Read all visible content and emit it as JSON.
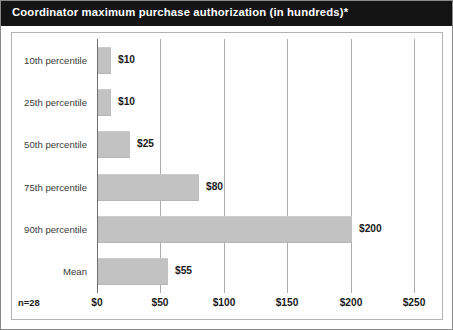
{
  "chart_data": {
    "type": "bar",
    "orientation": "horizontal",
    "title": "Coordinator maximum purchase authorization (in hundreds)*",
    "categories": [
      "10th percentile",
      "25th percentile",
      "50th percentile",
      "75th percentile",
      "90th percentile",
      "Mean"
    ],
    "values": [
      10,
      10,
      25,
      80,
      200,
      55
    ],
    "value_labels": [
      "$10",
      "$10",
      "$25",
      "$80",
      "$200",
      "$55"
    ],
    "xlabel": "",
    "ylabel": "",
    "xlim": [
      0,
      265
    ],
    "xticks": [
      0,
      50,
      100,
      150,
      200,
      250
    ],
    "xtick_labels": [
      "$0",
      "$50",
      "$100",
      "$150",
      "$200",
      "$250"
    ],
    "grid": true,
    "legend": false,
    "annotation": "n=28",
    "colors": {
      "bar": "#c2c2c2",
      "title_bar": "#141414",
      "title_text": "#ffffff",
      "gridline": "#adadad",
      "axis": "#6e6e6e",
      "frame": "#b4b4b4",
      "background": "#ffffff",
      "label_text": "#1a1a1a",
      "category_text": "#3a3a3a"
    }
  }
}
